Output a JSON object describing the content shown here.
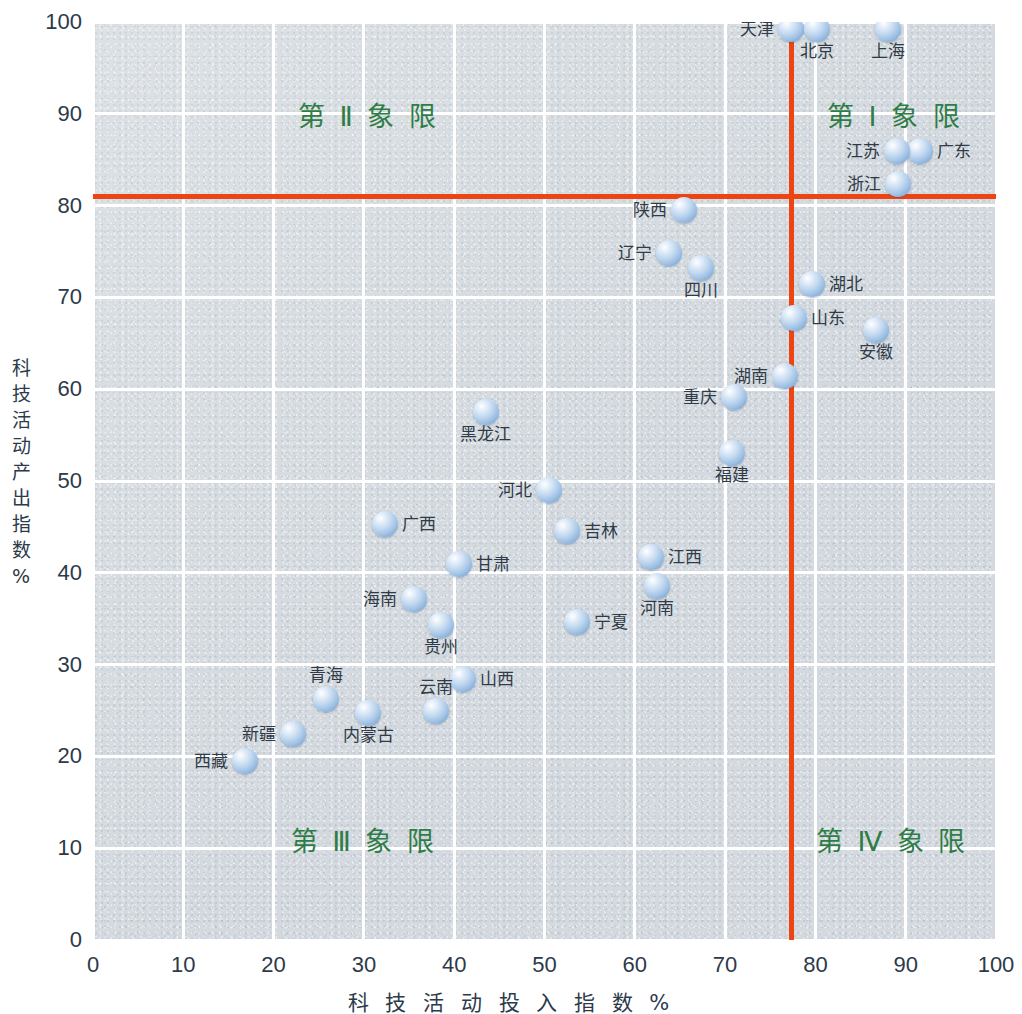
{
  "chart_data": {
    "type": "scatter",
    "title": "",
    "xlabel": "科 技 活 动 投 入 指 数 %",
    "ylabel": "科技活动产出指数 %",
    "xlim": [
      0,
      100
    ],
    "ylim": [
      0,
      100
    ],
    "xticks": [
      0,
      10,
      20,
      30,
      40,
      50,
      60,
      70,
      80,
      90,
      100
    ],
    "yticks": [
      0,
      10,
      20,
      30,
      40,
      50,
      60,
      70,
      80,
      90,
      100
    ],
    "grid": true,
    "legend": null,
    "colors": {
      "marker": "#9dc0e4",
      "threshold_line": "#ee4411",
      "quadrant_label": "#2f7d46",
      "plot_background": "#d3d9de",
      "gridline": "#ffffff",
      "tick_text": "#2c3a4a",
      "point_label": "#303b47"
    },
    "threshold_lines": {
      "x": 77.4,
      "y": 81.0
    },
    "points": [
      {
        "label": "天津",
        "x": 77.3,
        "y": 99.2,
        "label_pos": "left"
      },
      {
        "label": "北京",
        "x": 80.2,
        "y": 99.2,
        "label_pos": "below"
      },
      {
        "label": "上海",
        "x": 88.0,
        "y": 99.2,
        "label_pos": "below"
      },
      {
        "label": "广东",
        "x": 91.6,
        "y": 86.0,
        "label_pos": "right"
      },
      {
        "label": "江苏",
        "x": 89.0,
        "y": 85.9,
        "label_pos": "left"
      },
      {
        "label": "浙江",
        "x": 89.2,
        "y": 82.4,
        "label_pos": "left"
      },
      {
        "label": "陕西",
        "x": 65.5,
        "y": 79.5,
        "label_pos": "left"
      },
      {
        "label": "辽宁",
        "x": 63.8,
        "y": 74.8,
        "label_pos": "left"
      },
      {
        "label": "四川",
        "x": 67.3,
        "y": 73.2,
        "label_pos": "below"
      },
      {
        "label": "湖北",
        "x": 79.6,
        "y": 71.5,
        "label_pos": "right"
      },
      {
        "label": "山东",
        "x": 77.6,
        "y": 67.8,
        "label_pos": "right"
      },
      {
        "label": "安徽",
        "x": 86.7,
        "y": 66.5,
        "label_pos": "below"
      },
      {
        "label": "湖南",
        "x": 76.6,
        "y": 61.4,
        "label_pos": "left"
      },
      {
        "label": "重庆",
        "x": 71.0,
        "y": 59.2,
        "label_pos": "left"
      },
      {
        "label": "黑龙江",
        "x": 43.5,
        "y": 57.5,
        "label_pos": "below"
      },
      {
        "label": "福建",
        "x": 70.8,
        "y": 53.0,
        "label_pos": "below"
      },
      {
        "label": "河北",
        "x": 50.5,
        "y": 49.0,
        "label_pos": "left"
      },
      {
        "label": "广西",
        "x": 32.3,
        "y": 45.3,
        "label_pos": "right"
      },
      {
        "label": "吉林",
        "x": 52.5,
        "y": 44.5,
        "label_pos": "right"
      },
      {
        "label": "江西",
        "x": 61.8,
        "y": 41.7,
        "label_pos": "right"
      },
      {
        "label": "甘肃",
        "x": 40.5,
        "y": 41.0,
        "label_pos": "right"
      },
      {
        "label": "河南",
        "x": 62.5,
        "y": 38.6,
        "label_pos": "below"
      },
      {
        "label": "海南",
        "x": 35.5,
        "y": 37.1,
        "label_pos": "left"
      },
      {
        "label": "贵州",
        "x": 38.5,
        "y": 34.3,
        "label_pos": "below"
      },
      {
        "label": "宁夏",
        "x": 53.6,
        "y": 34.6,
        "label_pos": "right"
      },
      {
        "label": "山西",
        "x": 41.0,
        "y": 28.4,
        "label_pos": "right"
      },
      {
        "label": "青海",
        "x": 25.8,
        "y": 26.2,
        "label_pos": "above"
      },
      {
        "label": "云南",
        "x": 38.0,
        "y": 25.0,
        "label_pos": "above"
      },
      {
        "label": "内蒙古",
        "x": 30.5,
        "y": 24.7,
        "label_pos": "below"
      },
      {
        "label": "新疆",
        "x": 22.2,
        "y": 22.4,
        "label_pos": "left"
      },
      {
        "label": "西藏",
        "x": 16.8,
        "y": 19.5,
        "label_pos": "left"
      }
    ],
    "quadrant_labels": [
      {
        "text": "第 Ⅱ 象 限",
        "x": 30.5,
        "y": 90.0
      },
      {
        "text": "第 Ⅰ 象 限",
        "x": 88.8,
        "y": 90.0
      },
      {
        "text": "第 Ⅲ 象 限",
        "x": 30.0,
        "y": 11.0
      },
      {
        "text": "第 Ⅳ 象 限",
        "x": 88.5,
        "y": 11.0
      }
    ]
  }
}
